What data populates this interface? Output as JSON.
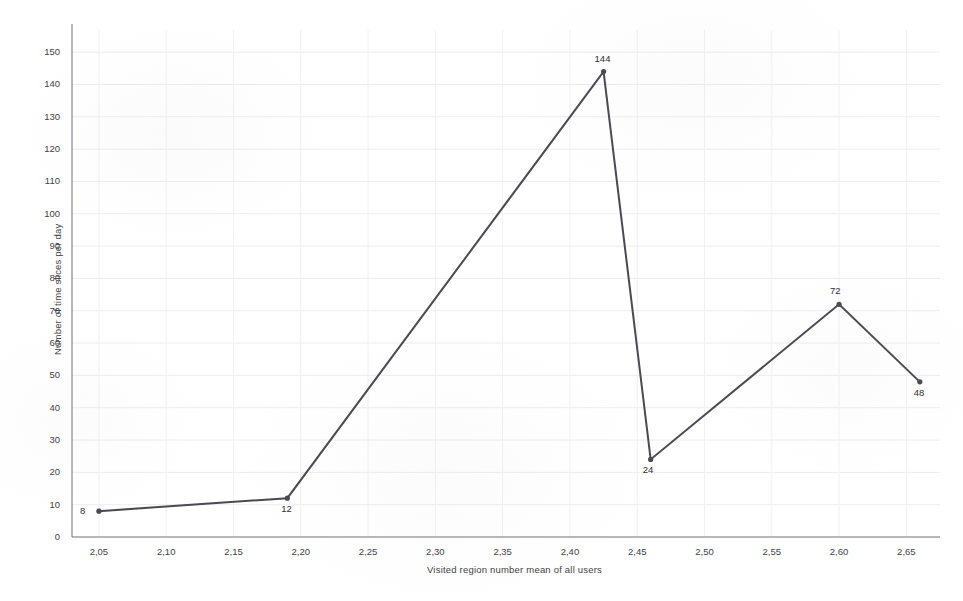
{
  "chart_data": {
    "type": "line",
    "title": "",
    "xlabel": "Visited region number mean of all users",
    "ylabel": "Number of time slices per day",
    "xlim": [
      2.03,
      2.675
    ],
    "ylim": [
      0,
      155
    ],
    "grid": true,
    "legend": false,
    "decimal_separator": ",",
    "x_tick_labels": [
      "2,05",
      "2,10",
      "2,15",
      "2,20",
      "2,25",
      "2,30",
      "2,35",
      "2,40",
      "2,45",
      "2,50",
      "2,55",
      "2,60",
      "2,65"
    ],
    "x_tick_values": [
      2.05,
      2.1,
      2.15,
      2.2,
      2.25,
      2.3,
      2.35,
      2.4,
      2.45,
      2.5,
      2.55,
      2.6,
      2.65
    ],
    "y_tick_labels": [
      "0",
      "10",
      "20",
      "30",
      "40",
      "50",
      "60",
      "70",
      "80",
      "90",
      "100",
      "110",
      "120",
      "130",
      "140",
      "150"
    ],
    "y_tick_values": [
      0,
      10,
      20,
      30,
      40,
      50,
      60,
      70,
      80,
      90,
      100,
      110,
      120,
      130,
      140,
      150
    ],
    "series": [
      {
        "name": "Number of time slices per day",
        "color": "#4a4a52",
        "x": [
          2.05,
          2.19,
          2.425,
          2.46,
          2.6,
          2.66
        ],
        "values": [
          8,
          12,
          144,
          24,
          72,
          48
        ],
        "point_labels": [
          "8",
          "12",
          "144",
          "24",
          "72",
          "48"
        ],
        "point_label_positions": [
          "left",
          "below-right",
          "above",
          "below",
          "above",
          "below-right"
        ]
      }
    ]
  },
  "axis": {
    "x_title": "Visited region number mean of all users",
    "y_title": "Number of time slices per day"
  }
}
